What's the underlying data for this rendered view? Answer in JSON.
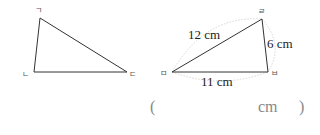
{
  "triangle_left": {
    "vertices": {
      "top": "ㄱ",
      "bottom_left": "ㄴ",
      "bottom_right": "ㄷ"
    }
  },
  "triangle_right": {
    "vertices": {
      "top": "ㄹ",
      "left": "ㅁ",
      "bottom_right": "ㅂ"
    },
    "sides": {
      "rm": "12 cm",
      "rb": "6 cm",
      "mb": "11 cm"
    }
  },
  "answer": {
    "open": "(",
    "unit": "cm",
    "close": ")"
  }
}
